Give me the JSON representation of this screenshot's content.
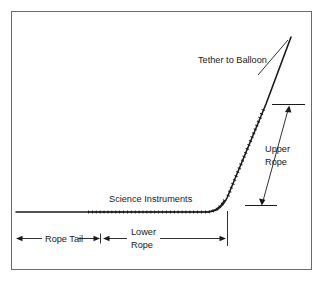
{
  "figure": {
    "name": "balloon-tether-rope-diagram",
    "background_color": "#ffffff",
    "frame": {
      "name": "diagram-border",
      "color": "#555555",
      "x": 11,
      "y": 11,
      "width": 301,
      "height": 259
    },
    "line_color": "#1a1a1a",
    "labels": {
      "tether": "Tether to Balloon",
      "upper_rope_line1": "Upper",
      "upper_rope_line2": "Rope",
      "science_instruments": "Science Instruments",
      "rope_tail": "Rope Tail",
      "lower_rope_line1": "Lower",
      "lower_rope_line2": "Rope"
    },
    "annotations": {
      "tether_leader_from": [
        268,
        66
      ],
      "tether_leader_to": [
        291,
        37
      ],
      "upper_rope_tick_top": [
        270,
        104
      ],
      "upper_rope_tick_bottom": [
        247,
        205
      ],
      "lower_rope_tick_x": 227,
      "rope_tail_span_start_x": 16,
      "rope_tail_span_end_x": 100,
      "lower_rope_span_start_x": 103,
      "lower_rope_span_end_x": 226,
      "instrument_segment_start_x": 88,
      "instrument_segment_end_x": 205
    }
  }
}
